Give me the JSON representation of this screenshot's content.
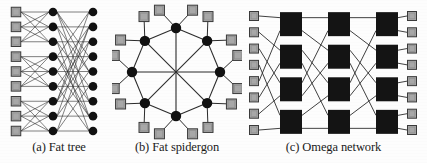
{
  "figure": {
    "background_color": "#fdfdfd",
    "node_color": "#111111",
    "terminal_color": "#a8a8a8",
    "terminal_border_color": "#3a3a3a",
    "link_color": "#2b2b2b",
    "switch_color": "#141414"
  },
  "panels": [
    {
      "id": "a",
      "caption": "(a) Fat tree",
      "topology": "fat-tree",
      "columns": [
        {
          "role": "terminals",
          "shape": "square",
          "count": 9,
          "fill": "#a8a8a8"
        },
        {
          "role": "switches-level-1",
          "shape": "circle",
          "count": 9,
          "fill": "#111111"
        },
        {
          "role": "switches-level-2",
          "shape": "circle",
          "count": 9,
          "fill": "#111111"
        }
      ],
      "group_size": 3,
      "terminal_count": 9,
      "stage_count": 2,
      "link_style": "thin-straight"
    },
    {
      "id": "b",
      "caption": "(b) Fat spidergon",
      "topology": "spidergon",
      "ring_nodes": 8,
      "terminals_per_node": 2,
      "terminal_count": 16,
      "shape": "circle-ring-with-diameters",
      "node_shape": "circle",
      "node_fill": "#111111",
      "terminal_shape": "square",
      "terminal_fill": "#a8a8a8",
      "has_cross_links": true,
      "cross_link_count": 4
    },
    {
      "id": "c",
      "caption": "(c) Omega network",
      "topology": "omega",
      "inputs": 8,
      "outputs": 8,
      "stages": 3,
      "switches_per_stage": 4,
      "switch_shape": "rectangle",
      "switch_fill": "#141414",
      "terminal_shape": "square",
      "terminal_fill": "#a8a8a8",
      "shuffle": "perfect-shuffle"
    }
  ]
}
